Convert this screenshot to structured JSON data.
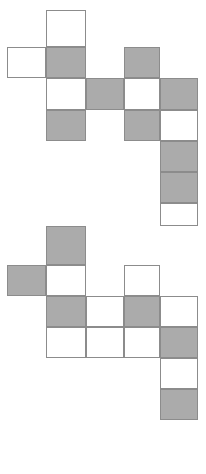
{
  "figure": {
    "title": "",
    "canvas": {
      "width": 206,
      "height": 474
    },
    "colors": {
      "filled": "#ababab",
      "empty": "#ffffff",
      "stroke": "#8c8c8c",
      "background": "#ffffff"
    },
    "grid": {
      "cell_width": 38.5,
      "cell_height": 31,
      "column_x": [
        7,
        45.5,
        86,
        124,
        160,
        198
      ],
      "row_y": [
        10,
        47,
        78,
        110,
        141,
        172,
        203,
        226,
        265,
        296,
        327,
        358,
        389,
        420
      ]
    },
    "shapes": [
      {
        "name": "upper-figure",
        "cells": [
          {
            "col": 1,
            "row": 0,
            "fill": "empty",
            "label": "upper-r0-c1"
          },
          {
            "col": 0,
            "row": 1,
            "fill": "empty",
            "label": "upper-r1-c0"
          },
          {
            "col": 1,
            "row": 1,
            "fill": "filled",
            "label": "upper-r1-c1"
          },
          {
            "col": 3,
            "row": 1,
            "fill": "filled",
            "label": "upper-r1-c3"
          },
          {
            "col": 1,
            "row": 2,
            "fill": "empty",
            "label": "upper-r2-c1"
          },
          {
            "col": 2,
            "row": 2,
            "fill": "filled",
            "label": "upper-r2-c2"
          },
          {
            "col": 3,
            "row": 2,
            "fill": "empty",
            "label": "upper-r2-c3"
          },
          {
            "col": 4,
            "row": 2,
            "fill": "filled",
            "label": "upper-r2-c4"
          },
          {
            "col": 1,
            "row": 3,
            "fill": "filled",
            "label": "upper-r3-c1"
          },
          {
            "col": 3,
            "row": 3,
            "fill": "filled",
            "label": "upper-r3-c3"
          },
          {
            "col": 4,
            "row": 3,
            "fill": "empty",
            "label": "upper-r3-c4"
          },
          {
            "col": 4,
            "row": 4,
            "fill": "filled",
            "label": "upper-r4-c4"
          },
          {
            "col": 4,
            "row": 5,
            "fill": "filled",
            "label": "upper-r5-c4"
          },
          {
            "col": 4,
            "row": 6,
            "fill": "empty",
            "label": "upper-r6-c4"
          }
        ]
      },
      {
        "name": "lower-figure",
        "cells": [
          {
            "col": 1,
            "row": 7,
            "fill": "filled",
            "label": "lower-r7-c1"
          },
          {
            "col": 0,
            "row": 8,
            "fill": "filled",
            "label": "lower-r8-c0"
          },
          {
            "col": 1,
            "row": 8,
            "fill": "empty",
            "label": "lower-r8-c1"
          },
          {
            "col": 3,
            "row": 8,
            "fill": "empty",
            "label": "lower-r8-c3"
          },
          {
            "col": 1,
            "row": 9,
            "fill": "filled",
            "label": "lower-r9-c1"
          },
          {
            "col": 2,
            "row": 9,
            "fill": "empty",
            "label": "lower-r9-c2"
          },
          {
            "col": 3,
            "row": 9,
            "fill": "filled",
            "label": "lower-r9-c3"
          },
          {
            "col": 4,
            "row": 9,
            "fill": "empty",
            "label": "lower-r9-c4"
          },
          {
            "col": 1,
            "row": 10,
            "fill": "empty",
            "label": "lower-r10-c1"
          },
          {
            "col": 2,
            "row": 10,
            "fill": "empty",
            "label": "lower-r10-c2"
          },
          {
            "col": 3,
            "row": 10,
            "fill": "empty",
            "label": "lower-r10-c3"
          },
          {
            "col": 4,
            "row": 10,
            "fill": "filled",
            "label": "lower-r10-c4"
          },
          {
            "col": 4,
            "row": 11,
            "fill": "empty",
            "label": "lower-r11-c4"
          },
          {
            "col": 4,
            "row": 12,
            "fill": "filled",
            "label": "lower-r12-c4"
          }
        ]
      }
    ]
  }
}
